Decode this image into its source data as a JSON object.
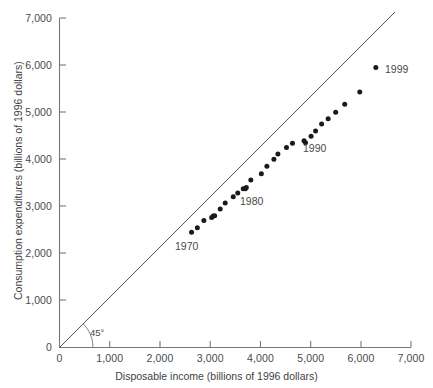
{
  "chart_data": {
    "type": "scatter",
    "title": "",
    "xlabel": "Disposable income (billions of 1996 dollars)",
    "ylabel": "Consumption expenditures (billions of 1996 dollars)",
    "xlim": [
      0,
      7000
    ],
    "ylim": [
      0,
      7000
    ],
    "grid": false,
    "legend": null,
    "xticks": [
      0,
      1000,
      2000,
      3000,
      4000,
      5000,
      6000,
      7000
    ],
    "xtick_labels": [
      "0",
      "1,000",
      "2,000",
      "3,000",
      "4,000",
      "5,000",
      "6,000",
      "7,000"
    ],
    "yticks": [
      0,
      1000,
      2000,
      3000,
      4000,
      5000,
      6000,
      7000
    ],
    "ytick_labels": [
      "0",
      "1,000",
      "2,000",
      "3,000",
      "4,000",
      "5,000",
      "6,000",
      "7,000"
    ],
    "reference_line": {
      "label": "45°",
      "slope": 1,
      "intercept": 0,
      "from": [
        0,
        0
      ],
      "to": [
        7000,
        7000
      ]
    },
    "annotations": [
      {
        "label": "1970",
        "x": 2630,
        "y": 2450
      },
      {
        "label": "1980",
        "x": 3660,
        "y": 3370
      },
      {
        "label": "1990",
        "x": 4900,
        "y": 4350
      },
      {
        "label": "1999",
        "x": 6300,
        "y": 5950
      }
    ],
    "series": [
      {
        "name": "Consumption vs disposable income",
        "marker": "filled-circle",
        "color": "#1a1a1a",
        "points": [
          {
            "year": 1970,
            "x": 2630,
            "y": 2450
          },
          {
            "year": 1971,
            "x": 2745,
            "y": 2545
          },
          {
            "year": 1972,
            "x": 2875,
            "y": 2700
          },
          {
            "year": 1973,
            "x": 3060,
            "y": 2795
          },
          {
            "year": 1974,
            "x": 3030,
            "y": 2760
          },
          {
            "year": 1975,
            "x": 3090,
            "y": 2800
          },
          {
            "year": 1976,
            "x": 3200,
            "y": 2940
          },
          {
            "year": 1977,
            "x": 3300,
            "y": 3070
          },
          {
            "year": 1978,
            "x": 3460,
            "y": 3200
          },
          {
            "year": 1979,
            "x": 3550,
            "y": 3280
          },
          {
            "year": 1980,
            "x": 3660,
            "y": 3370
          },
          {
            "year": 1981,
            "x": 3700,
            "y": 3370
          },
          {
            "year": 1982,
            "x": 3720,
            "y": 3400
          },
          {
            "year": 1983,
            "x": 3810,
            "y": 3560
          },
          {
            "year": 1984,
            "x": 4020,
            "y": 3690
          },
          {
            "year": 1985,
            "x": 4130,
            "y": 3850
          },
          {
            "year": 1986,
            "x": 4270,
            "y": 4000
          },
          {
            "year": 1987,
            "x": 4350,
            "y": 4110
          },
          {
            "year": 1988,
            "x": 4520,
            "y": 4250
          },
          {
            "year": 1989,
            "x": 4640,
            "y": 4340
          },
          {
            "year": 1990,
            "x": 4900,
            "y": 4350
          },
          {
            "year": 1991,
            "x": 4870,
            "y": 4390
          },
          {
            "year": 1992,
            "x": 5010,
            "y": 4490
          },
          {
            "year": 1993,
            "x": 5100,
            "y": 4600
          },
          {
            "year": 1994,
            "x": 5220,
            "y": 4750
          },
          {
            "year": 1995,
            "x": 5350,
            "y": 4860
          },
          {
            "year": 1996,
            "x": 5500,
            "y": 5000
          },
          {
            "year": 1997,
            "x": 5680,
            "y": 5170
          },
          {
            "year": 1998,
            "x": 5980,
            "y": 5430
          },
          {
            "year": 1999,
            "x": 6300,
            "y": 5950
          }
        ]
      }
    ]
  }
}
